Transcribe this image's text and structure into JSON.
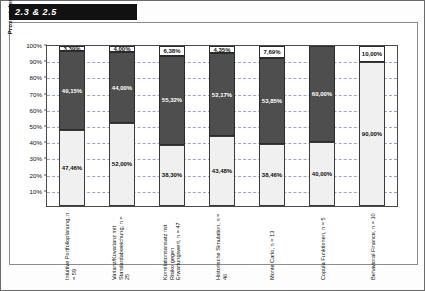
{
  "title": "2.3 & 2.5",
  "chart_data": {
    "type": "bar",
    "stacked": true,
    "title": "2.3 & 2.5",
    "xlabel": "",
    "ylabel": "Prozent der Antworten:Nutzung aktiv / passiv / k.A.",
    "ylim": [
      0,
      100
    ],
    "yticks": [
      "10%",
      "20%",
      "30%",
      "40%",
      "50%",
      "60%",
      "70%",
      "80%",
      "90%",
      "100%"
    ],
    "grid": true,
    "legend_position": "bottom-left",
    "categories": [
      "Intuitive Portfolioplanung, n = 59",
      "Varianz/Kovarianz mit Standardabweichung, n = 25",
      "Korrelationsansatz mit Risiko gegen Erwartungswert, n = 47",
      "Historische Simulation, n = 46",
      "Monte Carlo, n = 13",
      "Copula Funktionen, n = 5",
      "Behavioral Finance, n = 10"
    ],
    "series": [
      {
        "name": "aktiv",
        "values": [
          47.46,
          52.0,
          38.3,
          43.48,
          38.46,
          40.0,
          90.0
        ],
        "labels": [
          "47,46%",
          "52,00%",
          "38,30%",
          "43,48%",
          "38,46%",
          "40,00%",
          "90,00%"
        ]
      },
      {
        "name": "passiv",
        "values": [
          49.15,
          44.0,
          55.32,
          52.17,
          53.85,
          60.0,
          0
        ],
        "labels": [
          "49,15%",
          "44,00%",
          "55,32%",
          "52,17%",
          "53,85%",
          "60,00%",
          ""
        ]
      },
      {
        "name": "k.A.",
        "values": [
          3.39,
          4.0,
          6.38,
          4.35,
          7.69,
          0,
          10.0
        ],
        "labels": [
          "3,39%",
          "4,00%",
          "6,38%",
          "4,35%",
          "7,69%",
          "",
          "10,00%"
        ]
      }
    ]
  },
  "legend": {
    "items": [
      {
        "label": "aktiv",
        "key": "aktiv"
      },
      {
        "label": "passiv",
        "key": "passiv"
      },
      {
        "label": "k.A.",
        "key": "ka"
      }
    ]
  },
  "colors": {
    "aktiv": "#f0f0f0",
    "passiv": "#4e4e4e",
    "ka": "#ffffff",
    "grid": "#9aa7c4",
    "axis": "#4a4a4a",
    "badge_bg": "#111111",
    "badge_fg": "#ffffff"
  }
}
